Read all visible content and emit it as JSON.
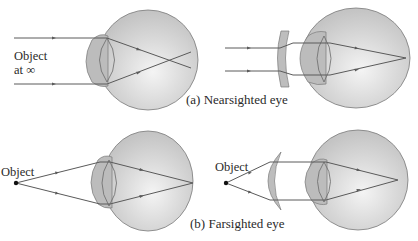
{
  "figure": {
    "panel_a": {
      "caption": "(a) Nearsighted eye",
      "object_label_line1": "Object",
      "object_label_line2": "at ∞",
      "left_description": "Uncorrected: parallel rays focus in front of the retina, then diverge",
      "right_description": "Corrected with diverging (concave) lens: rays focus on the retina"
    },
    "panel_b": {
      "caption": "(b) Farsighted eye",
      "object_label_left": "Object",
      "object_label_right": "Object",
      "left_description": "Uncorrected: rays from near object focus behind the retina",
      "right_description": "Corrected with converging (convex) lens: rays focus on the retina"
    },
    "icons": [
      "eyeball-icon",
      "crystalline-lens-icon",
      "concave-lens-icon",
      "convex-lens-icon",
      "ray-arrow-icon",
      "object-point-icon"
    ],
    "colors": {
      "eyeball_fill": "#c9c9c9",
      "eyeball_highlight": "#f2f2f2",
      "cornea_fill": "#b8b8b8",
      "outline": "#6e6e6e",
      "ray": "#5a5a5a",
      "corrective_lens": "#bdbdbd",
      "text": "#2a2a2a"
    }
  }
}
